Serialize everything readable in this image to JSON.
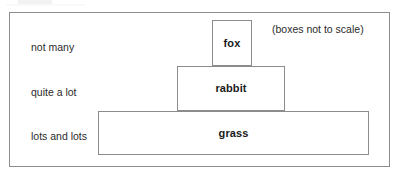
{
  "diagram": {
    "note": "(boxes not to scale)",
    "levels": [
      {
        "id": "fox",
        "organism": "fox",
        "abundance_label": "not many",
        "trophic_position": 3
      },
      {
        "id": "rabbit",
        "organism": "rabbit",
        "abundance_label": "quite a lot",
        "trophic_position": 2
      },
      {
        "id": "grass",
        "organism": "grass",
        "abundance_label": "lots and lots",
        "trophic_position": 1
      }
    ]
  },
  "colors": {
    "stroke": "#8c8c8c",
    "background": "#ffffff",
    "label_text": "#1a1a1a",
    "caption_text": "#2b2b2b"
  }
}
